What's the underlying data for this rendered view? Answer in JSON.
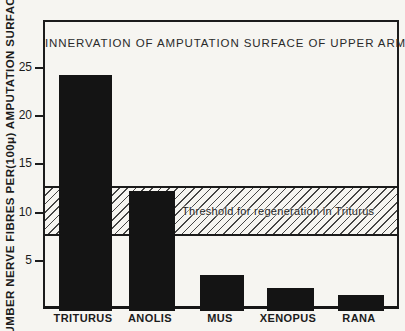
{
  "chart_data": {
    "type": "bar",
    "title": "INNERVATION OF AMPUTATION SURFACE OF UPPER ARM",
    "ylabel": "NUMBER NERVE FIBRES PER(100μ) AMPUTATION SURFACE",
    "xlabel": "",
    "categories": [
      "TRITURUS",
      "ANOLIS",
      "MUS",
      "XENOPUS",
      "RANA"
    ],
    "values": [
      24.5,
      12.5,
      3.7,
      2.4,
      1.7
    ],
    "yticks": [
      5,
      10,
      15,
      20,
      25
    ],
    "ylim": [
      0,
      30
    ],
    "grid": false,
    "legend": "none",
    "annotations": [
      {
        "type": "hatched-band",
        "label": "Threshold for regeneration in Triturus",
        "y_from": 8,
        "y_to": 13
      }
    ],
    "colors": {
      "bar": "#141414",
      "ink": "#1c1c1c",
      "background": "#f6f5f1"
    }
  }
}
